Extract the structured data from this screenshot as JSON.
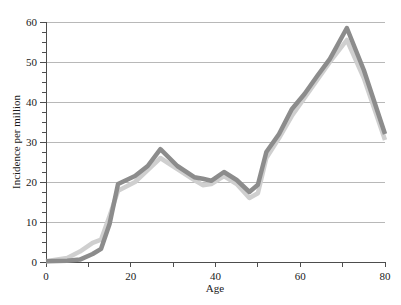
{
  "chart_data": {
    "type": "line",
    "title": "",
    "xlabel": "Age",
    "ylabel": "Incidence per million",
    "xlim": [
      0,
      80
    ],
    "ylim": [
      0,
      60
    ],
    "grid": true,
    "legend_position": "none",
    "x_ticks_labeled": [
      0,
      20,
      40,
      60,
      80
    ],
    "x_ticks_minor": [
      10,
      30,
      50,
      70
    ],
    "y_ticks_labeled": [
      0,
      10,
      20,
      30,
      40,
      50,
      60
    ],
    "y_ticks_minor": [
      2.5,
      5,
      7.5,
      12.5,
      15,
      17.5,
      22.5,
      25,
      27.5,
      32.5,
      35,
      37.5,
      42.5,
      45,
      47.5,
      52.5,
      55,
      57.5
    ],
    "x": [
      0,
      5,
      8,
      11,
      13,
      15,
      17,
      21,
      24,
      27,
      31,
      35,
      37,
      39,
      42,
      45,
      48,
      50,
      52,
      55,
      58,
      61,
      64,
      67,
      71,
      75,
      80
    ],
    "series": [
      {
        "name": "dark-series",
        "color": "#8c8c8c",
        "values": [
          0.2,
          0.3,
          0.6,
          2.0,
          3.3,
          9.5,
          19.5,
          21.5,
          24.0,
          28.2,
          24.0,
          21.2,
          20.8,
          20.3,
          22.5,
          20.5,
          17.5,
          19.3,
          27.5,
          32.0,
          38.2,
          42.0,
          46.5,
          50.8,
          58.5,
          48.0,
          32.0
        ]
      },
      {
        "name": "light-series",
        "color": "#cfcfcf",
        "values": [
          0.2,
          1.0,
          2.6,
          4.8,
          5.6,
          11.5,
          17.8,
          20.0,
          23.0,
          26.0,
          23.2,
          20.5,
          19.2,
          19.5,
          21.5,
          19.5,
          16.0,
          17.2,
          26.0,
          31.0,
          36.5,
          41.0,
          45.5,
          50.0,
          55.5,
          46.0,
          30.5
        ]
      }
    ]
  },
  "axes": {
    "x_title": "Age",
    "y_title": "Incidence per million",
    "x_tick_labels": [
      "0",
      "20",
      "40",
      "60",
      "80"
    ],
    "y_tick_labels": [
      "0",
      "10",
      "20",
      "30",
      "40",
      "50",
      "60"
    ]
  },
  "colors": {
    "dark_series": "#8c8c8c",
    "light_series": "#cfcfcf",
    "gridline": "#9a9a9a",
    "axis": "#4d4d4d",
    "text": "#1a1a1a",
    "background": "#ffffff"
  }
}
